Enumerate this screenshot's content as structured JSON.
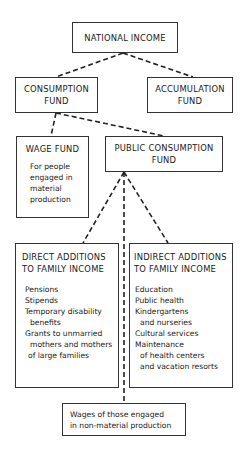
{
  "diagram": {
    "nodes": {
      "national_income": {
        "title": "NATIONAL INCOME"
      },
      "consumption_fund": {
        "title_line1": "CONSUMPTION",
        "title_line2": "FUND"
      },
      "accumulation_fund": {
        "title_line1": "ACCUMULATION",
        "title_line2": "FUND"
      },
      "wage_fund": {
        "title": "WAGE FUND",
        "lines": [
          "For people",
          "engaged in",
          "material",
          "production"
        ]
      },
      "public_consumption_fund": {
        "title_line1": "PUBLIC CONSUMPTION",
        "title_line2": "FUND"
      },
      "direct_additions": {
        "title_line1": "DIRECT ADDITIONS",
        "title_line2": "TO FAMILY INCOME",
        "items": [
          {
            "text": "Pensions",
            "indent": false
          },
          {
            "text": "Stipends",
            "indent": false
          },
          {
            "text": "Temporary disability",
            "indent": false
          },
          {
            "text": "benefits",
            "indent": true
          },
          {
            "text": "Grants to unmarried",
            "indent": false
          },
          {
            "text": "mothers and mothers",
            "indent": true
          },
          {
            "text": "of large families",
            "indent": true
          }
        ]
      },
      "indirect_additions": {
        "title_line1": "INDIRECT ADDITIONS",
        "title_line2": "TO FAMILY INCOME",
        "items": [
          {
            "text": "Education",
            "indent": false
          },
          {
            "text": "Public health",
            "indent": false
          },
          {
            "text": "Kindergartens",
            "indent": false
          },
          {
            "text": "and nurseries",
            "indent": true
          },
          {
            "text": "Cultural services",
            "indent": false
          },
          {
            "text": "Maintenance",
            "indent": false
          },
          {
            "text": "of health centers",
            "indent": true
          },
          {
            "text": "and vacation resorts",
            "indent": true
          }
        ]
      },
      "non_material_wages": {
        "line1": "Wages of those engaged",
        "line2": "in non-material production"
      }
    },
    "edges": [
      {
        "from": "national_income",
        "to": "consumption_fund",
        "style": "dashed"
      },
      {
        "from": "national_income",
        "to": "accumulation_fund",
        "style": "dashed"
      },
      {
        "from": "consumption_fund",
        "to": "wage_fund",
        "style": "dashed"
      },
      {
        "from": "consumption_fund",
        "to": "public_consumption_fund",
        "style": "dashed"
      },
      {
        "from": "public_consumption_fund",
        "to": "direct_additions",
        "style": "dashed"
      },
      {
        "from": "public_consumption_fund",
        "to": "indirect_additions",
        "style": "dashed"
      },
      {
        "from": "public_consumption_fund",
        "to": "non_material_wages",
        "style": "dashed"
      }
    ],
    "colors": {
      "line": "#222222",
      "border": "#333333",
      "background": "#ffffff"
    }
  }
}
